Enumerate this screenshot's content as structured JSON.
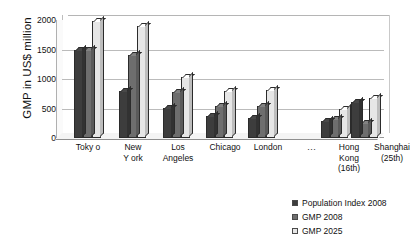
{
  "chart": {
    "type": "bar",
    "y_axis_title": "GMP in US$ million",
    "y_ticks": [
      "2000",
      "1500",
      "1000",
      "500",
      "0"
    ]
  },
  "chart_data": {
    "type": "bar",
    "title": "",
    "subtitle": "",
    "xlabel": "",
    "ylabel": "GMP in US$ million",
    "ylim": [
      0,
      2000
    ],
    "yticks": [
      0,
      500,
      1000,
      1500,
      2000
    ],
    "grid": true,
    "legend_position": "bottom-right",
    "style": "3d-clustered-column",
    "categories": [
      "Toky o",
      "New\nY ork",
      "Los\nAngeles",
      "Chicago",
      "London",
      "…",
      "Hong\nKong\n(16th)",
      "Shanghai\n(25th)"
    ],
    "series": [
      {
        "name": "Population Index 2008",
        "color": "#3d3d3d",
        "values": [
          1490,
          800,
          510,
          370,
          340,
          null,
          290,
          610
        ]
      },
      {
        "name": "GMP 2008",
        "color": "#6e6e6e",
        "values": [
          1490,
          1400,
          780,
          550,
          540,
          null,
          330,
          250
        ]
      },
      {
        "name": "GMP 2025",
        "color": "#e6e6e6",
        "values": [
          1975,
          1900,
          1030,
          800,
          810,
          null,
          490,
          670
        ]
      }
    ]
  },
  "legend": {
    "items": [
      {
        "label": "Population Index 2008",
        "color": "#3d3d3d"
      },
      {
        "label": "GMP 2008",
        "color": "#6e6e6e"
      },
      {
        "label": "GMP 2025",
        "color": "#e6e6e6"
      }
    ]
  }
}
